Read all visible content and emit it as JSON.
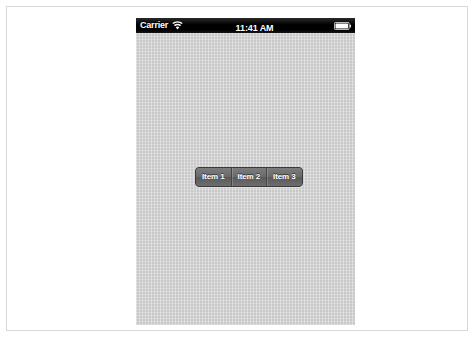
{
  "device": {
    "status_bar": {
      "carrier": "Carrier",
      "wifi_icon": "wifi-icon",
      "time": "11:41 AM",
      "battery_icon": "battery-icon"
    },
    "content": {
      "segmented_control": {
        "segments": [
          {
            "label": "Item 1"
          },
          {
            "label": "Item 2"
          },
          {
            "label": "Item 3"
          }
        ]
      }
    }
  },
  "colors": {
    "status_bar_background": "#000000",
    "status_bar_text": "#ffffff",
    "screen_background": "#cfcfcf",
    "segment_fill": "#6a6a6a",
    "segment_border": "#3a3a3a",
    "segment_text": "#ffffff",
    "page_border": "#d8d8d8",
    "page_background": "#ffffff"
  }
}
